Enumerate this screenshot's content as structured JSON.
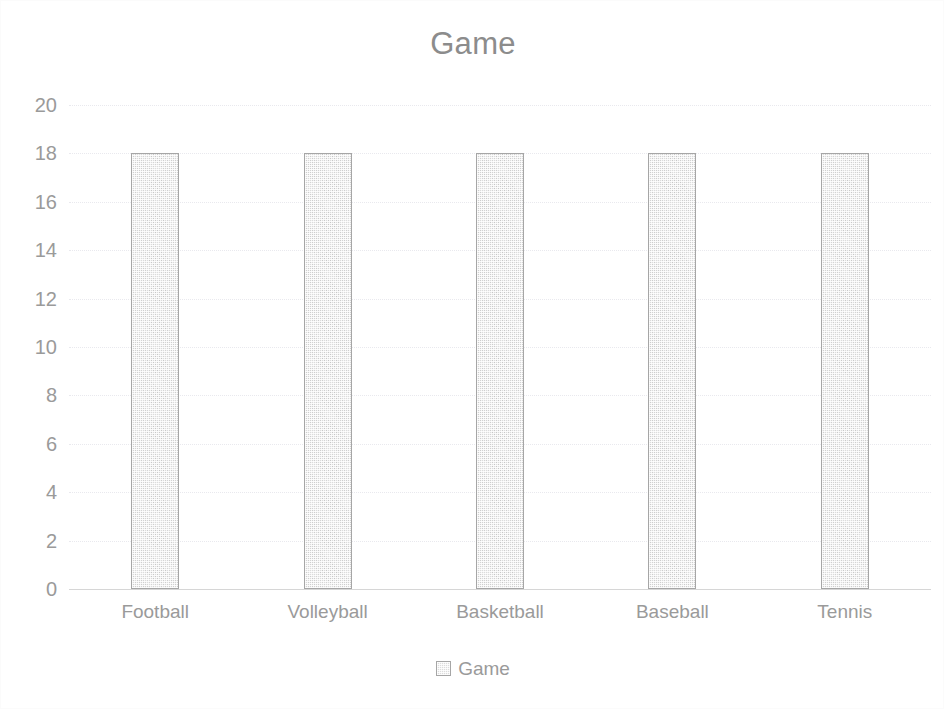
{
  "chart_data": {
    "type": "bar",
    "title": "Game",
    "xlabel": "",
    "ylabel": "",
    "categories": [
      "Football",
      "Volleyball",
      "Basketball",
      "Baseball",
      "Tennis"
    ],
    "series": [
      {
        "name": "Game",
        "values": [
          18,
          18,
          18,
          18,
          18
        ]
      }
    ],
    "ylim": [
      0,
      20
    ],
    "y_ticks": [
      20,
      18,
      16,
      14,
      12,
      10,
      8,
      6,
      4,
      2,
      0
    ],
    "grid": true,
    "legend_position": "bottom",
    "colors": {
      "bar_fill": "#dcdcdc",
      "bar_border": "#a6a6a6",
      "text": "#9a9a9a",
      "title_text": "#8c8c8c",
      "gridline": "#e9e9ee",
      "axis_line": "#d6d6d6",
      "background": "#ffffff"
    }
  },
  "legend": {
    "items": [
      {
        "label": "Game",
        "marker": "square-swatch"
      }
    ]
  }
}
